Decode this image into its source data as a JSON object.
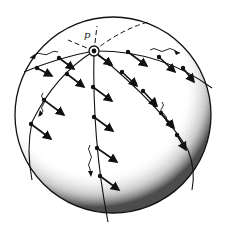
{
  "figure": {
    "type": "sphere-diagram",
    "pole_label": "p",
    "colors": {
      "ink": "#111111",
      "background": "#ffffff",
      "stipple": "#222222"
    }
  },
  "sphere": {
    "cx": 113,
    "cy": 115,
    "r": 98
  },
  "pole": {
    "x": 94,
    "y": 51
  },
  "meridians": [
    {
      "name": "left-arc",
      "path": "M94,51 Q60,57 24,72"
    },
    {
      "name": "left-meridian",
      "path": "M94,51 Q55,75 32,122 Q26,150 32,180"
    },
    {
      "name": "middle-meridian",
      "path": "M94,51 Q92,140 108,222"
    },
    {
      "name": "right-meridian",
      "path": "M94,51 Q165,110 188,150 Q196,170 192,190"
    },
    {
      "name": "top-right-arc",
      "path": "M94,51 Q160,50 212,88"
    }
  ],
  "dashed_lines": [
    {
      "name": "dashed-left",
      "path": "M94,51 L68,40"
    },
    {
      "name": "dashed-right",
      "path": "M94,51 Q120,30 148,22"
    },
    {
      "name": "dashed-up",
      "path": "M94,51 L97,26"
    }
  ],
  "arrows": [
    {
      "x1": 37,
      "y1": 68,
      "x2": 52,
      "y2": 76
    },
    {
      "x1": 59,
      "y1": 58,
      "x2": 74,
      "y2": 69
    },
    {
      "x1": 67,
      "y1": 74,
      "x2": 84,
      "y2": 87
    },
    {
      "x1": 44,
      "y1": 100,
      "x2": 64,
      "y2": 115
    },
    {
      "x1": 31,
      "y1": 124,
      "x2": 51,
      "y2": 139
    },
    {
      "x1": 93,
      "y1": 87,
      "x2": 112,
      "y2": 101
    },
    {
      "x1": 94,
      "y1": 117,
      "x2": 113,
      "y2": 131
    },
    {
      "x1": 97,
      "y1": 148,
      "x2": 117,
      "y2": 162
    },
    {
      "x1": 100,
      "y1": 176,
      "x2": 119,
      "y2": 190
    },
    {
      "x1": 128,
      "y1": 52,
      "x2": 147,
      "y2": 66
    },
    {
      "x1": 159,
      "y1": 57,
      "x2": 175,
      "y2": 72
    },
    {
      "x1": 183,
      "y1": 68,
      "x2": 194,
      "y2": 82
    },
    {
      "x1": 98,
      "y1": 55,
      "x2": 112,
      "y2": 65
    },
    {
      "x1": 122,
      "y1": 72,
      "x2": 137,
      "y2": 86
    },
    {
      "x1": 143,
      "y1": 91,
      "x2": 157,
      "y2": 106
    },
    {
      "x1": 161,
      "y1": 113,
      "x2": 174,
      "y2": 128
    },
    {
      "x1": 177,
      "y1": 135,
      "x2": 186,
      "y2": 150
    }
  ],
  "dots": [
    {
      "x": 37,
      "y": 68
    },
    {
      "x": 59,
      "y": 58
    },
    {
      "x": 67,
      "y": 74
    },
    {
      "x": 44,
      "y": 100
    },
    {
      "x": 31,
      "y": 124
    },
    {
      "x": 93,
      "y": 87
    },
    {
      "x": 94,
      "y": 117
    },
    {
      "x": 97,
      "y": 148
    },
    {
      "x": 100,
      "y": 176
    },
    {
      "x": 128,
      "y": 52
    },
    {
      "x": 159,
      "y": 57
    },
    {
      "x": 183,
      "y": 68
    },
    {
      "x": 110,
      "y": 64
    },
    {
      "x": 122,
      "y": 72
    },
    {
      "x": 135,
      "y": 84
    },
    {
      "x": 143,
      "y": 91
    },
    {
      "x": 155,
      "y": 105
    },
    {
      "x": 161,
      "y": 113
    },
    {
      "x": 172,
      "y": 126
    },
    {
      "x": 177,
      "y": 135
    }
  ],
  "wavy_arrows": [
    {
      "name": "wavy-top-left",
      "path": "M58,52 q-4,-2 -8,1 q-4,3 -8,1 q-4,-2 -8,1 l-4,3",
      "head": "M30,58 l6,-4 l-1,5 z"
    },
    {
      "name": "wavy-top-right",
      "path": "M150,50 q4,-3 8,0 q4,3 8,0 q4,-3 8,0 q4,3 6,3",
      "head": "M180,53 l-6,-3 l2,5 z"
    },
    {
      "name": "wavy-left",
      "path": "M43,93 q-3,3 0,6 q3,3 0,6 q-3,3 0,6 l-3,5",
      "head": "M38,117 l2,-7 l3,4 z"
    },
    {
      "name": "wavy-right",
      "path": "M162,102 q3,3 0,6 q-3,3 2,6 q4,3 2,7 l4,3",
      "head": "M172,126 l-6,-2 l3,-4 z"
    },
    {
      "name": "wavy-middle",
      "path": "M90,145 q-3,4 0,8 q3,4 0,8 q-3,4 0,8 l1,6",
      "head": "M91,177 l-3,-6 l5,0 z"
    }
  ]
}
